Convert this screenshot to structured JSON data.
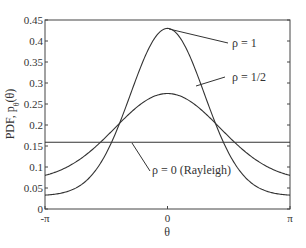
{
  "chart_data": {
    "type": "line",
    "title": "",
    "xlabel": "θ",
    "ylabel": "PDF, pθ(θ)",
    "xlim": [
      -3.14159,
      3.14159
    ],
    "ylim": [
      0,
      0.45
    ],
    "grid": false,
    "legend": "annotations",
    "x_ticks": [
      "-π",
      "0",
      "π"
    ],
    "y_ticks": [
      "0",
      "0.05",
      "0.1",
      "0.15",
      "0.2",
      "0.25",
      "0.3",
      "0.35",
      "0.4",
      "0.45"
    ],
    "series": [
      {
        "name": "ρ = 1",
        "rho": 1.0,
        "peak": 0.43,
        "edge_value": 0.033
      },
      {
        "name": "ρ = 1/2",
        "rho": 0.5,
        "peak": 0.275,
        "edge_value": 0.08
      },
      {
        "name": "ρ = 0 (Rayleigh)",
        "rho": 0.0,
        "peak": 0.159,
        "edge_value": 0.159
      }
    ],
    "annotations": [
      {
        "text": "ρ = 1",
        "target_series": "ρ = 1"
      },
      {
        "text": "ρ = 1/2",
        "target_series": "ρ = 1/2"
      },
      {
        "text": "ρ = 0 (Rayleigh)",
        "target_series": "ρ = 0 (Rayleigh)"
      }
    ]
  },
  "axes": {
    "xlabel": "θ",
    "ylabel_main": "PDF, p",
    "ylabel_sub": "θ",
    "ylabel_arg": "(θ)"
  }
}
